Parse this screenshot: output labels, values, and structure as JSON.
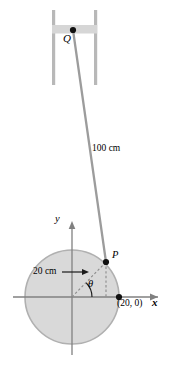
{
  "figure": {
    "type": "geometry-diagram",
    "top_cut_label": "",
    "colors": {
      "rod": "#9c9c9c",
      "rail": "#b8b8b8",
      "bar": "#d6d6d6",
      "circle_fill": "#d9d9d9",
      "circle_stroke": "#b0b0b0",
      "axis": "#808080",
      "dashed": "#8a8a8a",
      "point": "#111111",
      "text": "#000000"
    },
    "points": {
      "Q": {
        "label": "Q",
        "x": 73,
        "y": 30
      },
      "P": {
        "label": "P",
        "x": 106,
        "y": 262
      },
      "origin": {
        "label": "",
        "x": 72,
        "y": 297
      },
      "crank_end": {
        "label": "(20, 0)",
        "x": 119,
        "y": 297
      }
    },
    "labels": {
      "rod_length": "100 cm",
      "radius": "20 cm",
      "angle": "θ",
      "axis_x": "x",
      "axis_y": "y",
      "coordinate": "(20, 0)",
      "point_p": "P",
      "point_q": "Q"
    },
    "circle": {
      "center_x": 72,
      "center_y": 297,
      "radius": 47
    }
  }
}
